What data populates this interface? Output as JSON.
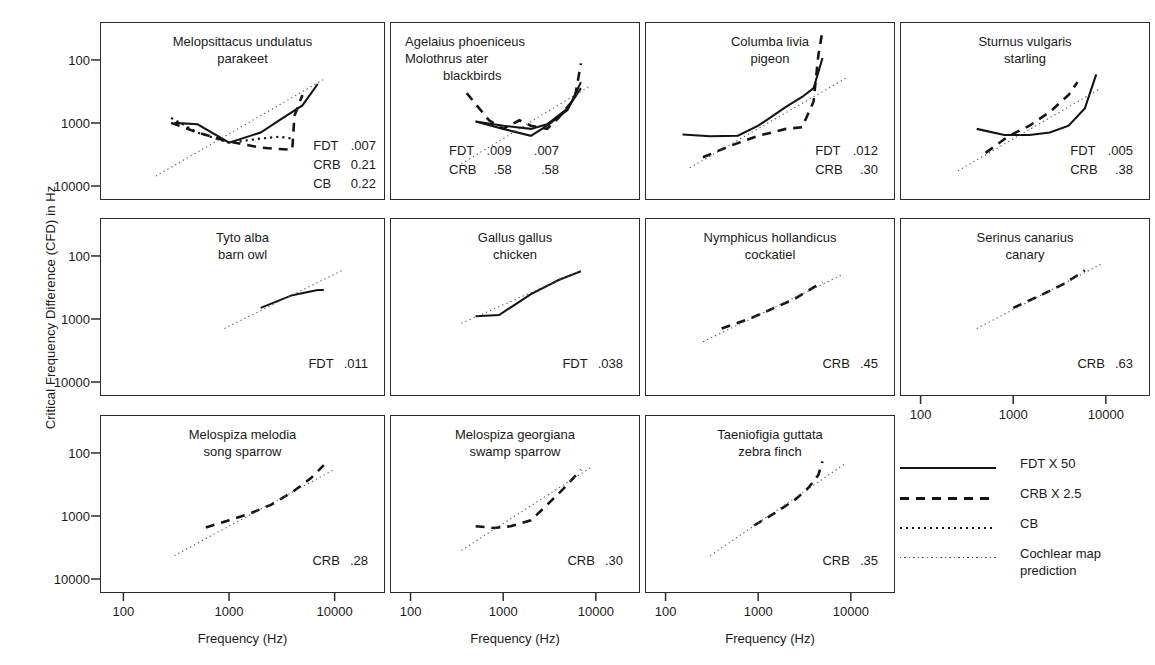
{
  "axes": {
    "ylabel": "Critical Frequency Difference (CFD) in Hz",
    "xlabel": "Frequency (Hz)",
    "yticks": [
      "10000",
      "1000",
      "100"
    ],
    "xticks": [
      "100",
      "1000",
      "10000"
    ]
  },
  "legend": {
    "items": [
      {
        "style": "solid",
        "label": "FDT X 50"
      },
      {
        "style": "dashed",
        "label": "CRB X 2.5"
      },
      {
        "style": "dotted",
        "label": "CB"
      },
      {
        "style": "fine-dotted",
        "label": "Cochlear map\nprediction"
      }
    ]
  },
  "panels": [
    {
      "id": "parakeet",
      "species": "Melopsittacus undulatus",
      "common": "parakeet",
      "title_align": "center",
      "stats": [
        {
          "key": "FDT",
          "values": [
            ".007"
          ]
        },
        {
          "key": "CRB",
          "values": [
            "0.21"
          ]
        },
        {
          "key": "CB",
          "values": [
            "0.22"
          ]
        }
      ]
    },
    {
      "id": "blackbirds",
      "species": "Agelaius phoeniceus",
      "species2": "Molothrus ater",
      "common": "blackbirds",
      "title_align": "left",
      "stats": [
        {
          "key": "FDT",
          "values": [
            ".009",
            ".007"
          ]
        },
        {
          "key": "CRB",
          "values": [
            ".58",
            ".58"
          ]
        }
      ]
    },
    {
      "id": "pigeon",
      "species": "Columba livia",
      "common": "pigeon",
      "title_align": "center",
      "stats": [
        {
          "key": "FDT",
          "values": [
            ".012"
          ]
        },
        {
          "key": "CRB",
          "values": [
            ".30"
          ]
        }
      ]
    },
    {
      "id": "starling",
      "species": "Sturnus vulgaris",
      "common": "starling",
      "title_align": "center",
      "stats": [
        {
          "key": "FDT",
          "values": [
            ".005"
          ]
        },
        {
          "key": "CRB",
          "values": [
            ".38"
          ]
        }
      ]
    },
    {
      "id": "barn-owl",
      "species": "Tyto alba",
      "common": "barn owl",
      "title_align": "center",
      "stats": [
        {
          "key": "FDT",
          "values": [
            ".011"
          ]
        }
      ]
    },
    {
      "id": "chicken",
      "species": "Gallus gallus",
      "common": "chicken",
      "title_align": "center",
      "stats": [
        {
          "key": "FDT",
          "values": [
            ".038"
          ]
        }
      ]
    },
    {
      "id": "cockatiel",
      "species": "Nymphicus hollandicus",
      "common": "cockatiel",
      "title_align": "center",
      "stats": [
        {
          "key": "CRB",
          "values": [
            ".45"
          ]
        }
      ]
    },
    {
      "id": "canary",
      "species": "Serinus canarius",
      "common": "canary",
      "title_align": "center",
      "stats": [
        {
          "key": "CRB",
          "values": [
            ".63"
          ]
        }
      ]
    },
    {
      "id": "song-sparrow",
      "species": "Melospiza melodia",
      "common": "song sparrow",
      "title_align": "center",
      "stats": [
        {
          "key": "CRB",
          "values": [
            ".28"
          ]
        }
      ]
    },
    {
      "id": "swamp-sparrow",
      "species": "Melospiza georgiana",
      "common": "swamp sparrow",
      "title_align": "center",
      "stats": [
        {
          "key": "CRB",
          "values": [
            ".30"
          ]
        }
      ]
    },
    {
      "id": "zebra-finch",
      "species": "Taeniofigia guttata",
      "common": "zebra finch",
      "title_align": "center",
      "stats": [
        {
          "key": "CRB",
          "values": [
            ".35"
          ]
        }
      ]
    }
  ],
  "chart_data": {
    "type": "line",
    "title": "",
    "xlabel": "Frequency (Hz)",
    "ylabel": "Critical Frequency Difference (CFD) in Hz",
    "xscale": "log",
    "yscale": "log",
    "xlim": [
      60,
      30000
    ],
    "ylim": [
      60,
      40000
    ],
    "xticks": [
      100,
      1000,
      10000
    ],
    "yticks": [
      100,
      1000,
      10000
    ],
    "grid": false,
    "legend_position": "right-bottom",
    "legend_entries": [
      "FDT X 50",
      "CRB X 2.5",
      "CB",
      "Cochlear map prediction"
    ],
    "panels": [
      {
        "name": "Melopsittacus undulatus / parakeet",
        "series": [
          {
            "name": "FDT X 50",
            "style": "solid",
            "x": [
              300,
              500,
              1000,
              2000,
              3000,
              5000,
              7000
            ],
            "y": [
              1000,
              950,
              480,
              700,
              1100,
              1900,
              4200
            ]
          },
          {
            "name": "CRB X 2.5",
            "style": "dashed",
            "x": [
              280,
              500,
              1000,
              2000,
              3000,
              4000,
              4200,
              5000
            ],
            "y": [
              1000,
              700,
              500,
              400,
              380,
              370,
              1300,
              2800
            ]
          },
          {
            "name": "CB",
            "style": "dotted",
            "x": [
              280,
              500,
              1000,
              2000,
              3000,
              4000
            ],
            "y": [
              1200,
              700,
              480,
              560,
              600,
              560
            ]
          },
          {
            "name": "Cochlear map prediction",
            "style": "fine-dotted",
            "x": [
              200,
              8000
            ],
            "y": [
              140,
              5000
            ]
          }
        ]
      },
      {
        "name": "Agelaius phoeniceus / Molothrus ater / blackbirds",
        "series": [
          {
            "name": "FDT X 50 (A. phoeniceus)",
            "style": "solid",
            "x": [
              500,
              1000,
              2000,
              3000,
              5000,
              7000
            ],
            "y": [
              1050,
              800,
              620,
              900,
              1600,
              4500
            ]
          },
          {
            "name": "FDT X 50 (M. ater)",
            "style": "solid",
            "x": [
              500,
              1000,
              2000,
              3000,
              5000,
              7000
            ],
            "y": [
              1050,
              900,
              800,
              950,
              1700,
              3600
            ]
          },
          {
            "name": "CRB X 2.5",
            "style": "dashed",
            "x": [
              400,
              700,
              1000,
              1500,
              2000,
              3000,
              4000,
              6000,
              7000
            ],
            "y": [
              3000,
              1100,
              800,
              1100,
              900,
              800,
              1200,
              2500,
              9000
            ]
          },
          {
            "name": "Cochlear map prediction",
            "style": "fine-dotted",
            "x": [
              350,
              9000
            ],
            "y": [
              220,
              4000
            ]
          }
        ]
      },
      {
        "name": "Columba livia / pigeon",
        "series": [
          {
            "name": "FDT X 50",
            "style": "solid",
            "x": [
              150,
              300,
              600,
              1000,
              2000,
              3000,
              4000,
              5000
            ],
            "y": [
              650,
              610,
              620,
              900,
              1800,
              2600,
              3600,
              11000
            ]
          },
          {
            "name": "CRB X 2.5",
            "style": "dashed",
            "x": [
              250,
              500,
              1000,
              2000,
              3000,
              4000,
              4500,
              5000
            ],
            "y": [
              280,
              430,
              620,
              800,
              850,
              2200,
              12000,
              30000
            ]
          },
          {
            "name": "Cochlear map prediction",
            "style": "fine-dotted",
            "x": [
              180,
              9000
            ],
            "y": [
              190,
              5200
            ]
          }
        ]
      },
      {
        "name": "Sturnus vulgaris / starling",
        "series": [
          {
            "name": "FDT X 50",
            "style": "solid",
            "x": [
              400,
              800,
              1500,
              2500,
              4000,
              6000,
              8000
            ],
            "y": [
              800,
              640,
              640,
              700,
              900,
              1700,
              6000
            ]
          },
          {
            "name": "CRB X 2.5",
            "style": "dashed",
            "x": [
              500,
              900,
              1500,
              2500,
              4000,
              5000
            ],
            "y": [
              330,
              620,
              900,
              1500,
              2800,
              4500
            ]
          },
          {
            "name": "Cochlear map prediction",
            "style": "fine-dotted",
            "x": [
              250,
              9000
            ],
            "y": [
              170,
              3600
            ]
          }
        ]
      },
      {
        "name": "Tyto alba / barn owl",
        "series": [
          {
            "name": "FDT X 50",
            "style": "solid",
            "x": [
              2000,
              4000,
              7000,
              8000
            ],
            "y": [
              1500,
              2400,
              2900,
              2900
            ]
          },
          {
            "name": "Cochlear map prediction",
            "style": "fine-dotted",
            "x": [
              900,
              12000
            ],
            "y": [
              700,
              6000
            ]
          }
        ]
      },
      {
        "name": "Gallus gallus / chicken",
        "series": [
          {
            "name": "FDT X 50",
            "style": "solid",
            "x": [
              500,
              900,
              2000,
              4000,
              7000
            ],
            "y": [
              1100,
              1150,
              2500,
              4200,
              5800
            ]
          },
          {
            "name": "Cochlear map prediction",
            "style": "fine-dotted",
            "x": [
              350,
              7500
            ],
            "y": [
              850,
              6200
            ]
          }
        ]
      },
      {
        "name": "Nymphicus hollandicus / cockatiel",
        "series": [
          {
            "name": "CRB X 2.5",
            "style": "dashed",
            "x": [
              400,
              800,
              1500,
              2500,
              4000,
              5000
            ],
            "y": [
              700,
              1000,
              1500,
              2100,
              3200,
              3900
            ]
          },
          {
            "name": "Cochlear map prediction",
            "style": "fine-dotted",
            "x": [
              250,
              8000
            ],
            "y": [
              430,
              5000
            ]
          }
        ]
      },
      {
        "name": "Serinus canarius / canary",
        "series": [
          {
            "name": "CRB X 2.5",
            "style": "dashed",
            "x": [
              1000,
              2000,
              3500,
              5000,
              6000
            ],
            "y": [
              1500,
              2400,
              3600,
              5000,
              6000
            ]
          },
          {
            "name": "Cochlear map prediction",
            "style": "fine-dotted",
            "x": [
              400,
              9000
            ],
            "y": [
              700,
              7500
            ]
          }
        ]
      },
      {
        "name": "Melospiza melodia / song sparrow",
        "series": [
          {
            "name": "CRB X 2.5",
            "style": "dashed",
            "x": [
              600,
              1000,
              1600,
              2500,
              4000,
              6000,
              8000
            ],
            "y": [
              650,
              850,
              1100,
              1500,
              2400,
              4000,
              6500
            ]
          },
          {
            "name": "Cochlear map prediction",
            "style": "fine-dotted",
            "x": [
              300,
              10000
            ],
            "y": [
              230,
              5500
            ]
          }
        ]
      },
      {
        "name": "Melospiza georgiana / swamp sparrow",
        "series": [
          {
            "name": "CRB X 2.5",
            "style": "dashed",
            "x": [
              500,
              800,
              1200,
              2000,
              3000,
              4500,
              7000
            ],
            "y": [
              680,
              640,
              680,
              850,
              1500,
              2700,
              5500
            ]
          },
          {
            "name": "Cochlear map prediction",
            "style": "fine-dotted",
            "x": [
              350,
              9000
            ],
            "y": [
              280,
              6000
            ]
          }
        ]
      },
      {
        "name": "Taeniofigia guttata / zebra finch",
        "series": [
          {
            "name": "CRB X 2.5",
            "style": "dashed",
            "x": [
              900,
              1500,
              2500,
              3500,
              4500,
              5000
            ],
            "y": [
              700,
              1100,
              1800,
              2800,
              4500,
              7500
            ]
          },
          {
            "name": "Cochlear map prediction",
            "style": "fine-dotted",
            "x": [
              300,
              9000
            ],
            "y": [
              230,
              7000
            ]
          }
        ]
      }
    ]
  }
}
